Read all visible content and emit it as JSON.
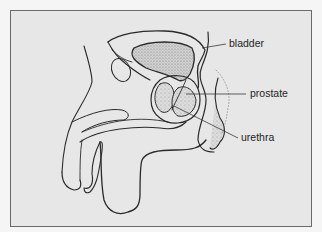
{
  "figure": {
    "colors": {
      "background": "#e7e7e7",
      "frame_border": "#6a6a6a",
      "line": "#2a2a2a",
      "stipple": "#9a9a9a"
    }
  },
  "labels": [
    {
      "id": "bladder",
      "text": "bladder",
      "x": 229,
      "y": 38
    },
    {
      "id": "prostate",
      "text": "prostate",
      "x": 250,
      "y": 86
    },
    {
      "id": "urethra",
      "text": "urethra",
      "x": 241,
      "y": 131
    }
  ]
}
